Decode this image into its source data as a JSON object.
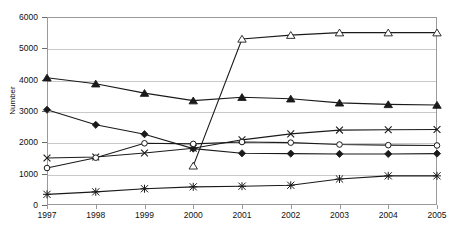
{
  "chart_data": {
    "type": "line",
    "title": "",
    "xlabel": "",
    "ylabel": "Number",
    "categories": [
      "1997",
      "1998",
      "1999",
      "2000",
      "2001",
      "2002",
      "2003",
      "2004",
      "2005"
    ],
    "x": [
      1997,
      1998,
      1999,
      2000,
      2001,
      2002,
      2003,
      2004,
      2005
    ],
    "ylim": [
      0,
      6000
    ],
    "ytick_labels": [
      "0",
      "1000",
      "2000",
      "3000",
      "4000",
      "5000",
      "6000"
    ],
    "yticks": [
      0,
      1000,
      2000,
      3000,
      4000,
      5000,
      6000
    ],
    "grid": true,
    "legend": "none",
    "series": [
      {
        "name": "series-open-triangle",
        "marker": "open-triangle",
        "values": [
          null,
          null,
          null,
          1250,
          5300,
          5420,
          5500,
          5500,
          5500
        ]
      },
      {
        "name": "series-filled-triangle",
        "marker": "filled-triangle",
        "values": [
          4060,
          3870,
          3570,
          3330,
          3440,
          3390,
          3260,
          3210,
          3190
        ]
      },
      {
        "name": "series-filled-diamond",
        "marker": "filled-diamond",
        "values": [
          3040,
          2560,
          2260,
          1800,
          1650,
          1640,
          1630,
          1630,
          1640
        ]
      },
      {
        "name": "series-cross",
        "marker": "cross-x",
        "values": [
          1500,
          1530,
          1660,
          1810,
          2080,
          2270,
          2390,
          2400,
          2410
        ]
      },
      {
        "name": "series-open-circle",
        "marker": "open-circle",
        "values": [
          1180,
          1510,
          1970,
          1950,
          2010,
          1990,
          1930,
          1910,
          1900
        ]
      },
      {
        "name": "series-asterisk",
        "marker": "asterisk",
        "values": [
          340,
          420,
          520,
          580,
          600,
          630,
          830,
          930,
          930
        ]
      }
    ]
  },
  "axes": {
    "y_title": "Number"
  }
}
